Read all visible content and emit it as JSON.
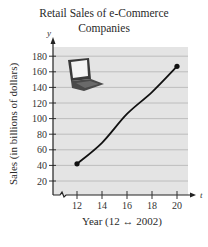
{
  "chart_data": {
    "type": "line",
    "title": "Retail Sales of e-Commerce Companies",
    "title_lines": [
      "Retail Sales of e-Commerce",
      "Companies"
    ],
    "xlabel": "Year (12 ↔ 2002)",
    "ylabel": "Sales (in billions of dollars)",
    "x_axis_variable": "t",
    "y_axis_variable": "y",
    "x_ticks": [
      12,
      14,
      16,
      18,
      20
    ],
    "y_ticks": [
      20,
      40,
      60,
      80,
      100,
      120,
      140,
      160,
      180
    ],
    "xlim": [
      10.2,
      21.2
    ],
    "ylim": [
      0,
      190
    ],
    "grid": "horizontal",
    "x_axis_break": true,
    "series": [
      {
        "name": "Retail sales",
        "x": [
          12,
          14,
          16,
          18,
          20
        ],
        "values": [
          42,
          69,
          106,
          134,
          167
        ],
        "endpoints_marked": true
      }
    ],
    "decoration": "laptop-image",
    "colors": {
      "plot_bg": "#e4e4e4",
      "grid": "#b9b9b9",
      "line": "#111111"
    }
  }
}
